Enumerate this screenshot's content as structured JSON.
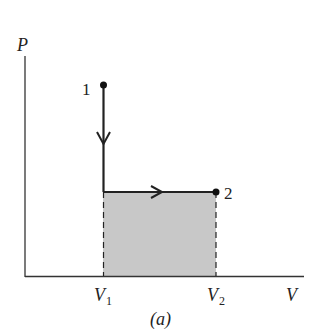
{
  "diagram": {
    "type": "PV diagram",
    "caption": "(a)",
    "axes": {
      "y_label": "P",
      "x_label": "V"
    },
    "ticks": {
      "v1_main": "V",
      "v1_sub": "1",
      "v2_main": "V",
      "v2_sub": "2"
    },
    "points": [
      {
        "label": "1",
        "x": 103,
        "y": 84
      },
      {
        "label": "2",
        "x": 216,
        "y": 192
      }
    ],
    "process": [
      "isochoric decrease in P from 1",
      "isobaric expansion from V1 to V2 ending at 2"
    ],
    "shaded_area": "work done between V1 and V2",
    "colors": {
      "line": "#222222",
      "shade": "#c8c8c8"
    }
  }
}
